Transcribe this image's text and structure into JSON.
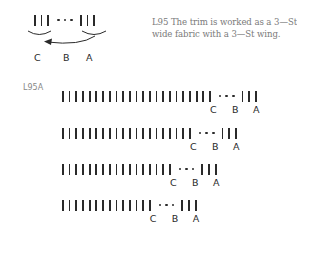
{
  "caption": {
    "line1": "L95 The trim is worked as a 3—St",
    "line2": "wide fabric with a 3—St wing."
  },
  "top_diagram": {
    "left_bars": 3,
    "right_bars": 3,
    "labels": [
      "C",
      "B",
      "A"
    ],
    "arrow": "arrow-left-icon"
  },
  "row_label": "L95A",
  "rows": [
    {
      "bars_before": 23,
      "bars_after": 3,
      "labels": [
        "C",
        "B",
        "A"
      ]
    },
    {
      "bars_before": 20,
      "bars_after": 3,
      "labels": [
        "C",
        "B",
        "A"
      ]
    },
    {
      "bars_before": 17,
      "bars_after": 3,
      "labels": [
        "C",
        "B",
        "A"
      ]
    },
    {
      "bars_before": 14,
      "bars_after": 3,
      "labels": [
        "C",
        "B",
        "A"
      ]
    }
  ],
  "colors": {
    "ink": "#2a2a2a",
    "caption": "#7a7a7a",
    "label": "#888888"
  }
}
